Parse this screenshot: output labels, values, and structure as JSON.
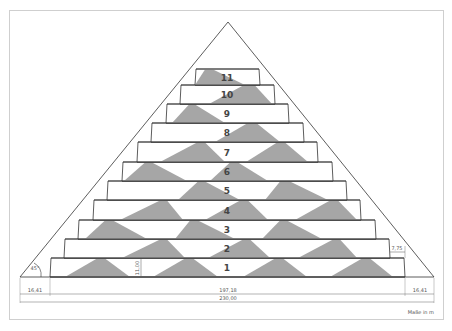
{
  "diagram": {
    "colors": {
      "line": "#333333",
      "fill_grey": "#a6a6a6",
      "dim_line": "#666666",
      "frame": "#cfcfcf"
    },
    "outline": {
      "apex": [
        228,
        22
      ],
      "base_left": [
        20,
        277
      ],
      "base_right": [
        434,
        277
      ]
    },
    "layers": [
      {
        "label": "1",
        "y_top": 258,
        "y_bot": 277,
        "x_left": 50,
        "x_right": 405,
        "shapes": [
          [
            65,
            97,
            105,
            130
          ],
          [
            153,
            185,
            193,
            218
          ],
          [
            243,
            275,
            283,
            307
          ],
          [
            330,
            362,
            370,
            393
          ]
        ]
      },
      {
        "label": "2",
        "y_top": 239,
        "y_bot": 258,
        "x_left": 64,
        "x_right": 390,
        "shapes": [
          [
            122,
            160,
            167,
            185
          ],
          [
            208,
            243,
            250,
            270
          ],
          [
            298,
            333,
            340,
            357
          ]
        ]
      },
      {
        "label": "3",
        "y_top": 220,
        "y_bot": 239,
        "x_left": 78,
        "x_right": 376,
        "shapes": [
          [
            85,
            105,
            113,
            147
          ],
          [
            175,
            190,
            198,
            235
          ],
          [
            262,
            280,
            287,
            322
          ]
        ]
      },
      {
        "label": "4",
        "y_top": 200,
        "y_bot": 220,
        "x_left": 93,
        "x_right": 361,
        "shapes": [
          [
            120,
            160,
            167,
            183
          ],
          [
            205,
            240,
            248,
            268
          ],
          [
            295,
            330,
            338,
            357
          ]
        ]
      },
      {
        "label": "5",
        "y_top": 181,
        "y_bot": 200,
        "x_left": 107,
        "x_right": 347,
        "shapes": [
          [
            178,
            198,
            205,
            240
          ],
          [
            265,
            280,
            290,
            328
          ]
        ]
      },
      {
        "label": "6",
        "y_top": 162,
        "y_bot": 181,
        "x_left": 122,
        "x_right": 333,
        "shapes": [
          [
            124,
            145,
            152,
            187
          ],
          [
            210,
            230,
            238,
            268
          ]
        ]
      },
      {
        "label": "7",
        "y_top": 142,
        "y_bot": 162,
        "x_left": 137,
        "x_right": 318,
        "shapes": [
          [
            160,
            197,
            205,
            225
          ],
          [
            246,
            277,
            285,
            308
          ]
        ]
      },
      {
        "label": "8",
        "y_top": 123,
        "y_bot": 142,
        "x_left": 151,
        "x_right": 304,
        "shapes": [
          [
            215,
            247,
            257,
            280
          ]
        ]
      },
      {
        "label": "9",
        "y_top": 104,
        "y_bot": 123,
        "x_left": 166,
        "x_right": 289,
        "shapes": [
          [
            172,
            189,
            195,
            225
          ]
        ]
      },
      {
        "label": "10",
        "y_top": 85,
        "y_bot": 104,
        "x_left": 180,
        "x_right": 275,
        "shapes": [
          [
            209,
            243,
            255,
            272
          ]
        ]
      },
      {
        "label": "11",
        "y_top": 69,
        "y_bot": 85,
        "x_left": 195,
        "x_right": 260,
        "shapes": [
          [
            195,
            205,
            213,
            245
          ]
        ]
      }
    ],
    "annotations": {
      "angle": "45°",
      "layer_height": "11,00",
      "step_width": "7,75",
      "left_offset": "16,41",
      "middle_width": "197,18",
      "right_offset": "16,41",
      "total_width": "230,00",
      "unit_note": "Maße in m"
    }
  }
}
